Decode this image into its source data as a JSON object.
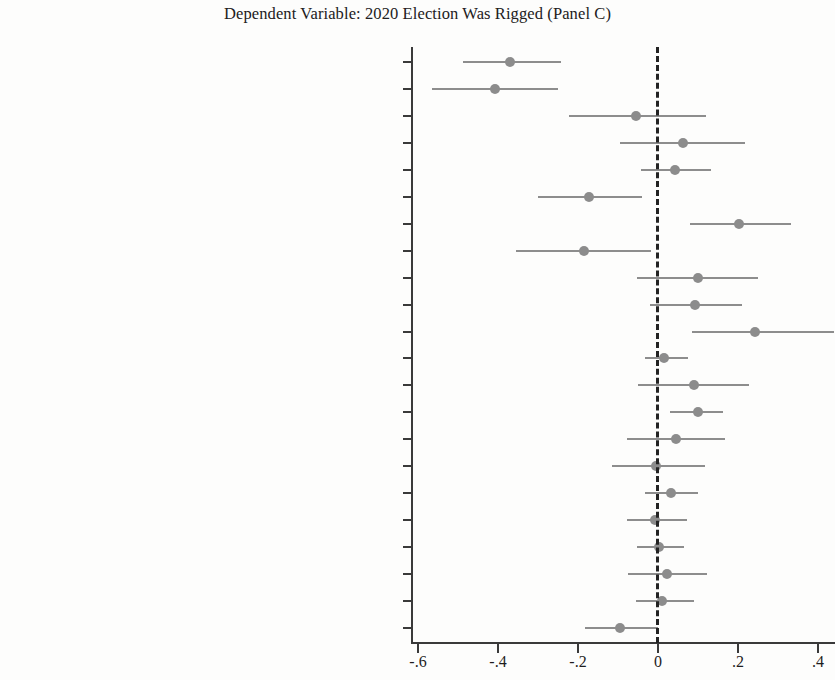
{
  "chart_data": {
    "type": "scatter",
    "title": "Dependent Variable: 2020 Election Was Rigged (Panel C)",
    "subtitle": "",
    "xlabel": "",
    "ylabel": "",
    "xlim": [
      -0.69,
      0.44
    ],
    "xticks": [
      -0.6,
      -0.4,
      -0.2,
      0,
      0.2,
      0.4
    ],
    "xticklabels": [
      "-.6",
      "-.4",
      "-.2",
      "0",
      ".2",
      ".4"
    ],
    "grid": false,
    "legend": "none",
    "reference_line": {
      "value": 0,
      "style": "dashed",
      "color": "#232323"
    },
    "marker_color": "#8c8c8c",
    "ci_color": "#8d8d8d",
    "ci_level": "95%",
    "orientation": "horizontal",
    "categories": [
      "Party identification (t₁)",
      "Ideological identification (t₁)",
      "Institutional support (t₁)",
      "Performance satisfaction (t₁)",
      "Ideological satisfaction (t₁)",
      "Ideological proximity to the Supreme Court (t₁)",
      "Political knowledge (t₁)",
      "Support for the rule of law (t₁)",
      "Valuation of individual liberty (t₁)",
      "Support for civil liberties (t₁)",
      "Open–mindedness (t₁)",
      "Gender (t₁)",
      "Age (t₁)",
      "Minority race (t₁)",
      "Level of education (t₁)",
      "Income (t₁)",
      "Homeownership (t₁)",
      "Metropolitan residence (t₁)",
      "Resident of the South (t₁)",
      "Internet access (t₁)",
      "Born-again (t₁)",
      "Church attendance (t₁)"
    ],
    "rows": [
      {
        "label_main": "Party identification",
        "label_sub": "1",
        "estimate": -0.37,
        "ci_low": -0.487,
        "ci_high": -0.243
      },
      {
        "label_main": "Ideological identification",
        "label_sub": "1",
        "estimate": -0.408,
        "ci_low": -0.565,
        "ci_high": -0.25
      },
      {
        "label_main": "Institutional support",
        "label_sub": "1",
        "estimate": -0.055,
        "ci_low": -0.222,
        "ci_high": 0.12
      },
      {
        "label_main": "Performance satisfaction",
        "label_sub": "1",
        "estimate": 0.062,
        "ci_low": -0.095,
        "ci_high": 0.218
      },
      {
        "label_main": "Ideological satisfaction",
        "label_sub": "1",
        "estimate": 0.042,
        "ci_low": -0.042,
        "ci_high": 0.132
      },
      {
        "label_main": "Ideological proximity to the Supreme Court",
        "label_sub": "1",
        "estimate": -0.172,
        "ci_low": -0.3,
        "ci_high": -0.04
      },
      {
        "label_main": "Political knowledge",
        "label_sub": "1",
        "estimate": 0.202,
        "ci_low": 0.08,
        "ci_high": 0.332
      },
      {
        "label_main": "Support for the rule of law",
        "label_sub": "1",
        "estimate": -0.185,
        "ci_low": -0.355,
        "ci_high": -0.018
      },
      {
        "label_main": "Valuation of individual liberty",
        "label_sub": "1",
        "estimate": 0.1,
        "ci_low": -0.052,
        "ci_high": 0.25
      },
      {
        "label_main": "Support for civil liberties",
        "label_sub": "1",
        "estimate": 0.092,
        "ci_low": -0.02,
        "ci_high": 0.21
      },
      {
        "label_main": "Open–mindedness",
        "label_sub": "1",
        "estimate": 0.243,
        "ci_low": 0.085,
        "ci_high": 0.44
      },
      {
        "label_main": "Gender",
        "label_sub": "1",
        "estimate": 0.015,
        "ci_low": -0.032,
        "ci_high": 0.075
      },
      {
        "label_main": "Age",
        "label_sub": "1",
        "estimate": 0.09,
        "ci_low": -0.05,
        "ci_high": 0.228
      },
      {
        "label_main": "Minority race",
        "label_sub": "1",
        "estimate": 0.1,
        "ci_low": 0.03,
        "ci_high": 0.163
      },
      {
        "label_main": "Level of education",
        "label_sub": "1",
        "estimate": 0.045,
        "ci_low": -0.078,
        "ci_high": 0.168
      },
      {
        "label_main": "Income",
        "label_sub": "1",
        "estimate": -0.005,
        "ci_low": -0.115,
        "ci_high": 0.118
      },
      {
        "label_main": "Homeownership",
        "label_sub": "1",
        "estimate": 0.032,
        "ci_low": -0.032,
        "ci_high": 0.1
      },
      {
        "label_main": "Metropolitan residence",
        "label_sub": "1",
        "estimate": -0.008,
        "ci_low": -0.078,
        "ci_high": 0.072
      },
      {
        "label_main": "Resident of the South",
        "label_sub": "1",
        "estimate": 0.002,
        "ci_low": -0.052,
        "ci_high": 0.065
      },
      {
        "label_main": "Internet access",
        "label_sub": "1",
        "estimate": 0.022,
        "ci_low": -0.075,
        "ci_high": 0.122
      },
      {
        "label_main": "Born-again",
        "label_sub": "1",
        "estimate": 0.01,
        "ci_low": -0.055,
        "ci_high": 0.09
      },
      {
        "label_main": "Church attendance",
        "label_sub": "1",
        "estimate": -0.095,
        "ci_low": -0.182,
        "ci_high": 0.0
      }
    ]
  }
}
